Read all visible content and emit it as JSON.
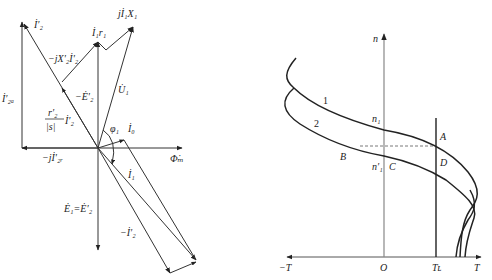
{
  "phasor_diagram": {
    "labels": {
      "i2_prime": "İ′₂",
      "i2a_prime": "İ′₂ₐ",
      "i1_r1": "İ₁r₁",
      "j_i1_x1": "jİ₁X₁",
      "neg_j_x2_i2": "−jX′₂İ′₂",
      "neg_e2": "−Ė′₂",
      "u1": "U̇₁",
      "r2_over_s_num": "r′₂",
      "r2_over_s_den": "|s|",
      "r2_over_s_i2": "İ′₂",
      "phi1": "φ₁",
      "i0": "İ₀",
      "neg_j_i2r": "−jİ′₂ᵣ",
      "phi_m": "Φ̇ₘ",
      "i1": "İ₁",
      "e1_eq_e2": "Ė₁=Ė′₂",
      "neg_i2": "−İ′₂"
    }
  },
  "speed_torque_diagram": {
    "axis_labels": {
      "n": "n",
      "neg_t": "−T",
      "origin": "O",
      "t_load": "Tʟ",
      "t": "T"
    },
    "curve_labels": {
      "curve1": "1",
      "curve2": "2"
    },
    "point_labels": {
      "n1": "n₁",
      "n1_prime": "n′₁",
      "A": "A",
      "B": "B",
      "C": "C",
      "D": "D"
    }
  }
}
